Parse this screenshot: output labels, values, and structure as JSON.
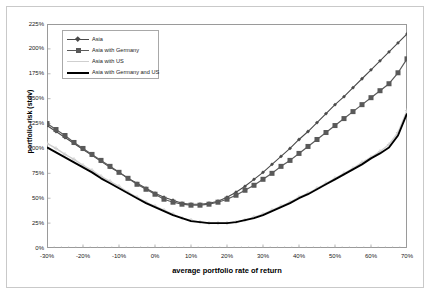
{
  "chart_data": {
    "type": "line",
    "title": "",
    "xlabel": "average portfolio rate of return",
    "ylabel": "portfolio risk (stdv)",
    "xlim": [
      -30,
      70
    ],
    "ylim": [
      0,
      225
    ],
    "xticks": [
      "-30%",
      "-20%",
      "-10%",
      "0%",
      "10%",
      "20%",
      "30%",
      "40%",
      "50%",
      "60%",
      "70%"
    ],
    "xtick_values": [
      -30,
      -20,
      -10,
      0,
      10,
      20,
      30,
      40,
      50,
      60,
      70
    ],
    "yticks": [
      "0%",
      "25%",
      "50%",
      "75%",
      "100%",
      "125%",
      "150%",
      "175%",
      "200%",
      "225%"
    ],
    "ytick_values": [
      0,
      25,
      50,
      75,
      100,
      125,
      150,
      175,
      200,
      225
    ],
    "grid": false,
    "legend_position": "top-left",
    "x": [
      -30,
      -27.5,
      -25,
      -22.5,
      -20,
      -17.5,
      -15,
      -12.5,
      -10,
      -7.5,
      -5,
      -2.5,
      0,
      2.5,
      5,
      7.5,
      10,
      12.5,
      15,
      17.5,
      20,
      22.5,
      25,
      27.5,
      30,
      32.5,
      35,
      37.5,
      40,
      42.5,
      45,
      47.5,
      50,
      52.5,
      55,
      57.5,
      60,
      62.5,
      65,
      67.5,
      70
    ],
    "series": [
      {
        "name": "Asia",
        "color": "#4a4a4a",
        "marker": "diamond",
        "marker_size": 3,
        "line_width": 1.1,
        "values": [
          123,
          117,
          111,
          105,
          99,
          93,
          87,
          81,
          76,
          70,
          65,
          60,
          55,
          51,
          48,
          45,
          44,
          44,
          45,
          47,
          51,
          56,
          62,
          69,
          76,
          84,
          92,
          100,
          109,
          117,
          126,
          135,
          144,
          152,
          161,
          170,
          179,
          188,
          197,
          206,
          215
        ]
      },
      {
        "name": "Asia with Germany",
        "color": "#595959",
        "marker": "square",
        "marker_size": 5,
        "line_width": 1.2,
        "values": [
          125,
          119,
          113,
          106,
          100,
          94,
          88,
          82,
          76,
          70,
          64,
          59,
          54,
          49,
          46,
          44,
          43,
          43,
          44,
          46,
          49,
          53,
          58,
          63,
          69,
          75,
          82,
          88,
          95,
          102,
          109,
          116,
          123,
          130,
          137,
          144,
          151,
          158,
          165,
          176,
          190
        ]
      },
      {
        "name": "Asia with US",
        "color": "#cfcfcf",
        "marker": "cross",
        "marker_size": 3,
        "line_width": 1.4,
        "values": [
          105,
          100,
          94,
          89,
          83,
          78,
          72,
          67,
          62,
          56,
          51,
          46,
          42,
          38,
          34,
          30,
          28,
          26,
          25,
          25,
          25,
          26,
          28,
          31,
          34,
          38,
          42,
          46,
          51,
          55,
          60,
          65,
          70,
          75,
          80,
          86,
          91,
          97,
          104,
          116,
          138
        ]
      },
      {
        "name": "Asia with Germany and US",
        "color": "#000000",
        "marker": "none",
        "marker_size": 0,
        "line_width": 1.9,
        "values": [
          101,
          96,
          91,
          86,
          81,
          76,
          70,
          65,
          60,
          55,
          50,
          45,
          41,
          37,
          33,
          30,
          27,
          26,
          25,
          25,
          25,
          26,
          28,
          30,
          33,
          37,
          41,
          45,
          50,
          54,
          59,
          64,
          69,
          74,
          79,
          84,
          90,
          95,
          101,
          113,
          135
        ]
      }
    ]
  }
}
